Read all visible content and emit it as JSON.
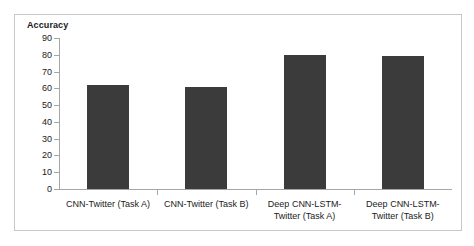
{
  "chart_data": {
    "type": "bar",
    "title": "Accuracy",
    "xlabel": "",
    "ylabel": "",
    "ylim": [
      0,
      90
    ],
    "ytick_step": 10,
    "yticks": [
      90,
      80,
      70,
      60,
      50,
      40,
      30,
      20,
      10,
      0
    ],
    "grid": false,
    "legend": false,
    "legend_position": "none",
    "bar_color": "#3b3b3b",
    "categories": [
      "CNN-Twitter (Task A)",
      "CNN-Twitter (Task B)",
      "Deep CNN-LSTM-Twitter (Task A)",
      "Deep CNN-LSTM-Twitter (Task B)"
    ],
    "category_lines": [
      [
        "CNN-Twitter (Task A)"
      ],
      [
        "CNN-Twitter (Task B)"
      ],
      [
        "Deep CNN-LSTM-",
        "Twitter (Task A)"
      ],
      [
        "Deep CNN-LSTM-",
        "Twitter (Task B)"
      ]
    ],
    "values": [
      62,
      61,
      80,
      79
    ]
  },
  "colors": {
    "frame_border": "#c8c8c8",
    "axis": "#a6a6a6",
    "text": "#1a1a1a",
    "background": "#ffffff"
  }
}
